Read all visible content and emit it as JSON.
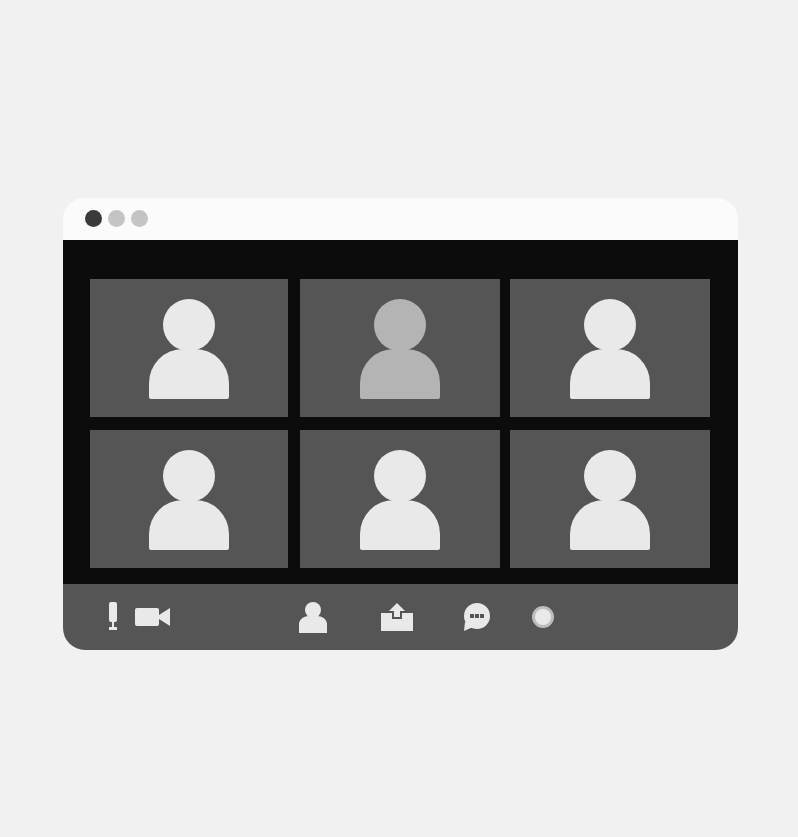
{
  "window": {
    "title_bar": {
      "controls": [
        {
          "name": "close",
          "color": "#3a3a3a"
        },
        {
          "name": "minimize",
          "color": "#c4c4c4"
        },
        {
          "name": "maximize",
          "color": "#c4c4c4"
        }
      ]
    },
    "grid": {
      "rows": 2,
      "columns": 3,
      "participants": [
        {
          "icon": "user-avatar-icon",
          "active": false,
          "color": "#e9e9e9"
        },
        {
          "icon": "user-avatar-icon",
          "active": true,
          "color": "#b4b4b4"
        },
        {
          "icon": "user-avatar-icon",
          "active": false,
          "color": "#e9e9e9"
        },
        {
          "icon": "user-avatar-icon",
          "active": false,
          "color": "#e9e9e9"
        },
        {
          "icon": "user-avatar-icon",
          "active": false,
          "color": "#e9e9e9"
        },
        {
          "icon": "user-avatar-icon",
          "active": false,
          "color": "#e9e9e9"
        }
      ]
    },
    "toolbar": {
      "items": [
        {
          "icon": "microphone-icon"
        },
        {
          "icon": "video-camera-icon"
        },
        {
          "icon": "participants-icon"
        },
        {
          "icon": "share-screen-icon"
        },
        {
          "icon": "chat-icon"
        },
        {
          "icon": "record-icon"
        }
      ]
    }
  },
  "colors": {
    "background": "#f1f1f1",
    "stage": "#0c0c0c",
    "tile": "#555555",
    "icon": "#e9e9e9"
  }
}
